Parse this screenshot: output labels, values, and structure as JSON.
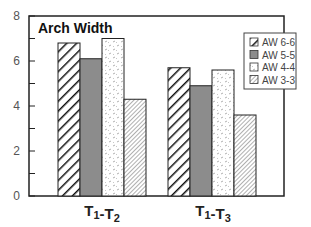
{
  "chart_data": {
    "type": "bar",
    "title": "Arch Width",
    "xlabel": "",
    "ylabel": "",
    "ylim": [
      0,
      8
    ],
    "yticks": [
      0,
      2,
      4,
      6,
      8
    ],
    "grid": false,
    "legend_position": "upper right (inside)",
    "categories": [
      "T1-T2",
      "T1-T3"
    ],
    "category_labels": [
      {
        "main": "T",
        "sub1": "1",
        "dash": "-",
        "main2": "T",
        "sub2": "2"
      },
      {
        "main": "T",
        "sub1": "1",
        "dash": "-",
        "main2": "T",
        "sub2": "3"
      }
    ],
    "series": [
      {
        "name": "AW 6-6",
        "values": [
          6.8,
          5.7
        ],
        "pattern": "bold-diagonal-hatch"
      },
      {
        "name": "AW 5-5",
        "values": [
          6.1,
          4.9
        ],
        "pattern": "solid-gray"
      },
      {
        "name": "AW 4-4",
        "values": [
          7.0,
          5.6
        ],
        "pattern": "light-dotted"
      },
      {
        "name": "AW 3-3",
        "values": [
          4.3,
          3.6
        ],
        "pattern": "fine-diagonal-hatch"
      }
    ]
  },
  "colors": {
    "axis": "#222222",
    "solid_gray": "#8c8c8c",
    "hatch": "#111111",
    "fine_hatch": "#777777"
  }
}
